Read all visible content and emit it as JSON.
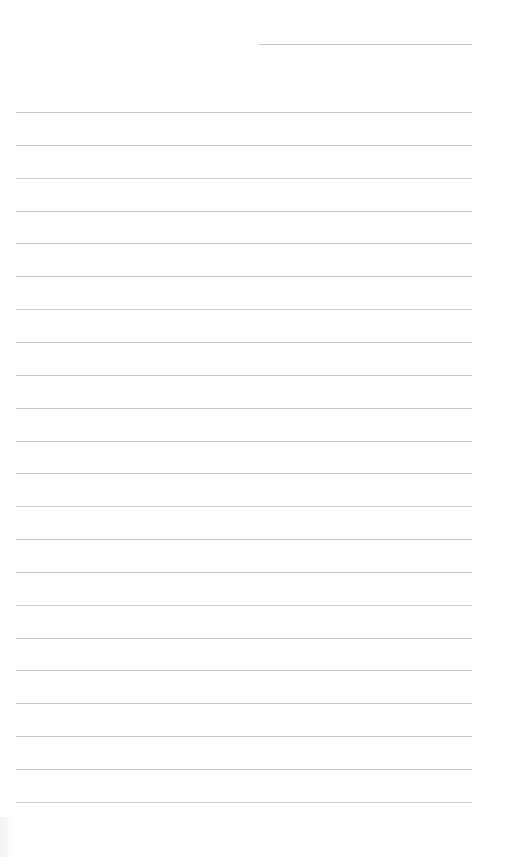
{
  "page": {
    "type": "lined-notepaper",
    "background_color": "#ffffff",
    "line_color": "#c8c8c8",
    "header_line": {
      "top": 44,
      "left": 259,
      "width": 213
    },
    "rules": {
      "count": 22,
      "first_top": 112,
      "spacing": 32.85,
      "left": 16,
      "width": 456
    }
  }
}
